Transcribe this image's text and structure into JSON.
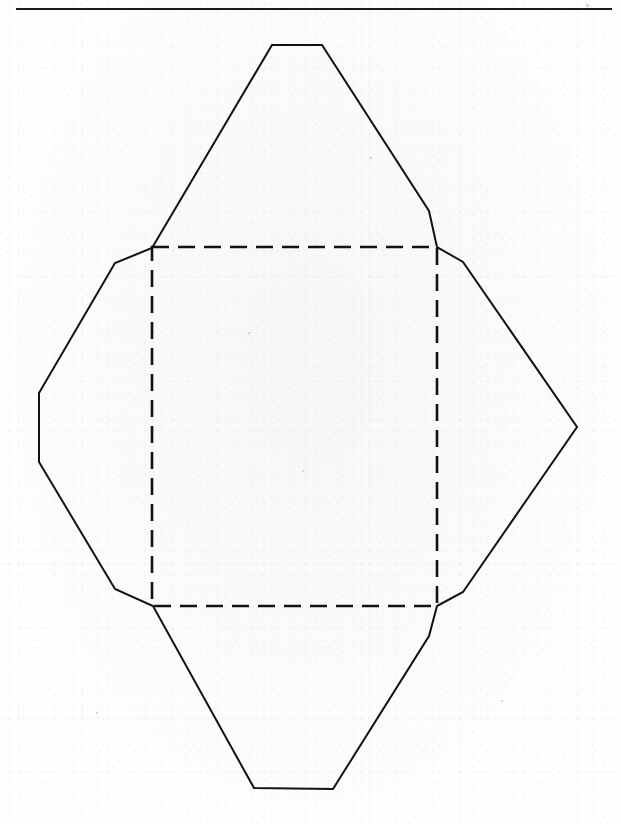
{
  "page": {
    "width": 621,
    "height": 824,
    "background_color": "#fefefe",
    "ink_color": "#1a1a1a",
    "kind": "scanned-document-figure",
    "caption": "",
    "header_rule": {
      "x": 16,
      "y": 8,
      "width": 596,
      "height": 2,
      "color": "#1a1a1a"
    }
  },
  "figure": {
    "name": "box-net-diagram",
    "stroke_color": "#121212",
    "solid_stroke_width": 2.0,
    "dashed_stroke_width": 2.6,
    "dash_pattern": "17 9",
    "outline_points": "272,45 322,45 429,211 437,247 463,262 577,427 463,592 437,606 429,636 333,789 254,788 153,606 115,589 39,462 39,393 115,263 152,248",
    "fold_square": {
      "x": 152,
      "y": 247,
      "width": 285,
      "height": 359,
      "top_left": "152,247",
      "top_right": "437,247",
      "bottom_right": "437,606",
      "bottom_left": "152,606"
    },
    "vertices": [
      {
        "name": "top-left-flat",
        "x": 272,
        "y": 45
      },
      {
        "name": "top-right-flat",
        "x": 322,
        "y": 45
      },
      {
        "name": "upper-right-bend",
        "x": 429,
        "y": 211
      },
      {
        "name": "fold-top-right",
        "x": 437,
        "y": 247
      },
      {
        "name": "right-upper-shoulder",
        "x": 463,
        "y": 262
      },
      {
        "name": "right-tip",
        "x": 577,
        "y": 427
      },
      {
        "name": "right-lower-shoulder",
        "x": 463,
        "y": 592
      },
      {
        "name": "fold-bottom-right",
        "x": 437,
        "y": 606
      },
      {
        "name": "lower-right-bend",
        "x": 429,
        "y": 636
      },
      {
        "name": "bottom-right-flat",
        "x": 333,
        "y": 789
      },
      {
        "name": "bottom-left-flat",
        "x": 254,
        "y": 788
      },
      {
        "name": "fold-bottom-left",
        "x": 153,
        "y": 606
      },
      {
        "name": "left-lower-shoulder",
        "x": 115,
        "y": 589
      },
      {
        "name": "left-bottom-corner",
        "x": 39,
        "y": 462
      },
      {
        "name": "left-top-corner",
        "x": 39,
        "y": 393
      },
      {
        "name": "left-upper-shoulder",
        "x": 115,
        "y": 263
      },
      {
        "name": "fold-top-left",
        "x": 152,
        "y": 248
      }
    ]
  },
  "specks": [
    {
      "x": 586,
      "y": 4,
      "size": 3
    },
    {
      "x": 370,
      "y": 157,
      "size": 2
    },
    {
      "x": 248,
      "y": 332,
      "size": 2
    },
    {
      "x": 501,
      "y": 700,
      "size": 2
    },
    {
      "x": 96,
      "y": 712,
      "size": 2
    },
    {
      "x": 302,
      "y": 470,
      "size": 2
    }
  ]
}
